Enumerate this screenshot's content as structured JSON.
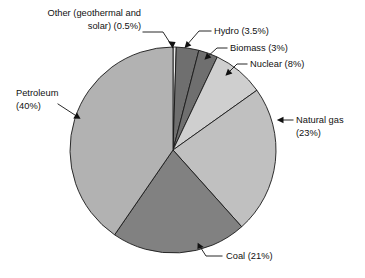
{
  "chart_data": {
    "type": "pie",
    "title": "",
    "subtitle": "",
    "xlabel": "",
    "ylabel": "",
    "legend_position": "none",
    "grid": false,
    "units": "percent",
    "start_angle_deg": 0,
    "direction": "clockwise",
    "categories": [
      "Other (geothermal and solar)",
      "Hydro",
      "Biomass",
      "Nuclear",
      "Natural gas",
      "Coal",
      "Petroleum"
    ],
    "values": [
      0.5,
      3.5,
      3,
      8,
      23,
      21,
      40
    ],
    "slice_colors": [
      "#e9e9e9",
      "#6f6f6f",
      "#6f6f6f",
      "#cfcfcf",
      "#c0c0c0",
      "#818181",
      "#b2b2b2"
    ],
    "labels": [
      "Other (geothermal and solar) (0.5%)",
      "Hydro (3.5%)",
      "Biomass (3%)",
      "Nuclear (8%)",
      "Natural gas (23%)",
      "Coal (21%)",
      "Petroleum (40%)"
    ]
  },
  "callouts": {
    "other": {
      "line1": "Other (geothermal and",
      "line2": "solar) (0.5%)"
    },
    "hydro": {
      "line1": "Hydro (3.5%)"
    },
    "biomass": {
      "line1": "Biomass (3%)"
    },
    "nuclear": {
      "line1": "Nuclear (8%)"
    },
    "natural_gas": {
      "line1": "Natural gas",
      "line2": "(23%)"
    },
    "coal": {
      "line1": "Coal (21%)"
    },
    "petroleum": {
      "line1": "Petroleum",
      "line2": "(40%)"
    }
  },
  "colors": {
    "background": "#ffffff",
    "text": "#111111",
    "outline": "#1a1a1a"
  }
}
